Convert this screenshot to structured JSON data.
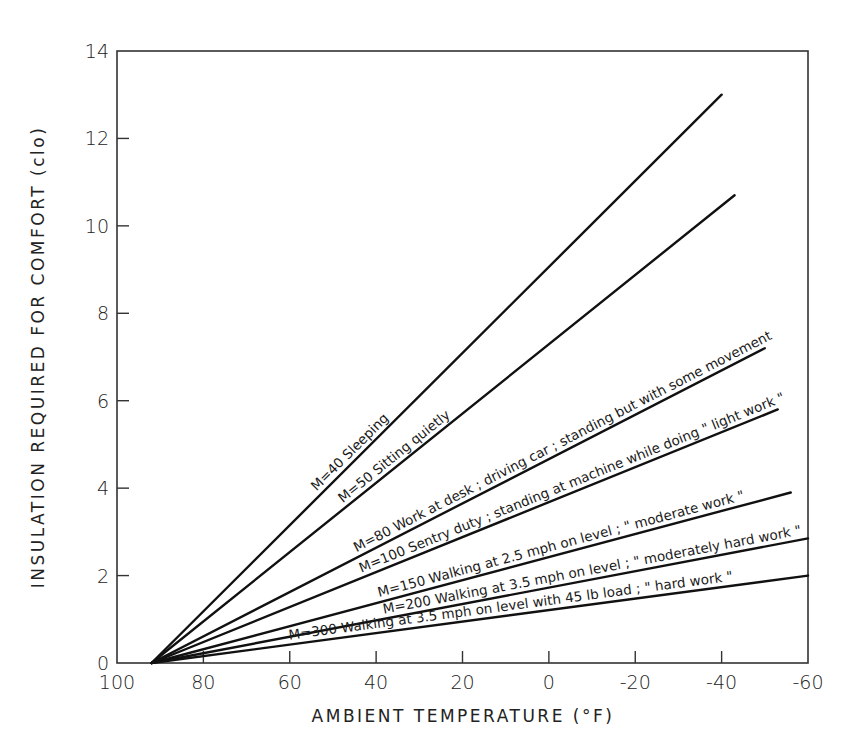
{
  "chart_data": {
    "type": "line",
    "title": "",
    "xlabel": "AMBIENT TEMPERATURE (°F)",
    "ylabel": "INSULATION REQUIRED FOR COMFORT (clo)",
    "xlim": [
      100,
      -60
    ],
    "ylim": [
      0,
      14
    ],
    "x_ticks": [
      100,
      80,
      60,
      40,
      20,
      0,
      -20,
      -40,
      -60
    ],
    "x_tick_labels": [
      "100",
      "80",
      "60",
      "40",
      "20",
      "0",
      "-20",
      "-40",
      "-60"
    ],
    "y_ticks": [
      0,
      2,
      4,
      6,
      8,
      10,
      12,
      14
    ],
    "y_tick_labels": [
      "0",
      "2",
      "4",
      "6",
      "8",
      "10",
      "12",
      "14"
    ],
    "grid": false,
    "legend": "inline labels along each line",
    "series": [
      {
        "name": "M=40 Sleeping",
        "x": [
          92,
          -40
        ],
        "y": [
          0,
          13.0
        ]
      },
      {
        "name": "M=50 Sitting quietly",
        "x": [
          92,
          -43
        ],
        "y": [
          0,
          10.7
        ]
      },
      {
        "name": "M=80 Work at desk; driving car; standing but with some movement",
        "x": [
          92,
          -50
        ],
        "y": [
          0,
          7.2
        ]
      },
      {
        "name": "M=100 Sentry duty; standing at machine while doing \"light work\"",
        "x": [
          92,
          -53
        ],
        "y": [
          0,
          5.8
        ]
      },
      {
        "name": "M=150 Walking at 2.5 mph on level; \"moderate work\"",
        "x": [
          92,
          -56
        ],
        "y": [
          0,
          3.9
        ]
      },
      {
        "name": "M=200 Walking at 3.5 mph on level; \"moderately hard work\"",
        "x": [
          92,
          -60
        ],
        "y": [
          0,
          2.85
        ]
      },
      {
        "name": "M=300 Walking at 3.5 mph on level with 45 lb load; \"hard work\"",
        "x": [
          92,
          -60
        ],
        "y": [
          0,
          2.0
        ]
      }
    ],
    "labels": [
      "M=40 Sleeping",
      "M=50 Sitting quietly",
      "M=80 Work at desk ; driving car ; standing but with some movement",
      "M=100 Sentry duty ; standing at machine while doing \" light work \"",
      "M=150 Walking at 2.5 mph on level ; \" moderate work \"",
      "M=200 Walking at 3.5 mph on level ; \" moderately hard work \"",
      "M=300 Walking at 3.5 mph on level with 45 lb load ; \" hard work \""
    ]
  }
}
